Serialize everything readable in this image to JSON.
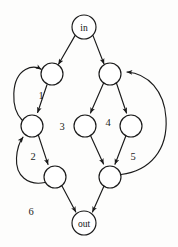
{
  "figure": {
    "type": "directed-graph",
    "background_color": "#fdfdfc",
    "stroke_color": "#1a1a1a",
    "node_fill": "#ffffff",
    "width": 178,
    "height": 247
  },
  "graph_data": {
    "type": "diagram",
    "title": "",
    "nodes": [
      {
        "id": "in",
        "label": "in",
        "cx": 84,
        "cy": 27,
        "r": 12
      },
      {
        "id": "n1",
        "label": "",
        "cx": 52,
        "cy": 74,
        "r": 11
      },
      {
        "id": "n2",
        "label": "",
        "cx": 110,
        "cy": 74,
        "r": 11
      },
      {
        "id": "n3",
        "label": "",
        "cx": 32,
        "cy": 126,
        "r": 11
      },
      {
        "id": "n4",
        "label": "",
        "cx": 85,
        "cy": 126,
        "r": 11
      },
      {
        "id": "n5",
        "label": "",
        "cx": 131,
        "cy": 126,
        "r": 11
      },
      {
        "id": "n6",
        "label": "",
        "cx": 55,
        "cy": 177,
        "r": 11
      },
      {
        "id": "n7",
        "label": "",
        "cx": 110,
        "cy": 177,
        "r": 11
      },
      {
        "id": "out",
        "label": "out",
        "cx": 84,
        "cy": 223,
        "r": 12
      }
    ],
    "edges": [
      {
        "from": "in",
        "to": "n1",
        "style": "straight"
      },
      {
        "from": "in",
        "to": "n2",
        "style": "straight"
      },
      {
        "from": "n1",
        "to": "n3",
        "style": "straight"
      },
      {
        "from": "n3",
        "to": "n1",
        "style": "curve-left"
      },
      {
        "from": "n3",
        "to": "n6",
        "style": "straight"
      },
      {
        "from": "n6",
        "to": "n3",
        "style": "curve-left"
      },
      {
        "from": "n2",
        "to": "n4",
        "style": "straight"
      },
      {
        "from": "n2",
        "to": "n5",
        "style": "straight"
      },
      {
        "from": "n4",
        "to": "n7",
        "style": "straight"
      },
      {
        "from": "n5",
        "to": "n7",
        "style": "straight"
      },
      {
        "from": "n7",
        "to": "n2",
        "style": "curve-right-large"
      },
      {
        "from": "n6",
        "to": "out",
        "style": "straight"
      },
      {
        "from": "n7",
        "to": "out",
        "style": "straight"
      }
    ],
    "region_labels": [
      {
        "text": "1",
        "x": 41,
        "y": 95
      },
      {
        "text": "2",
        "x": 33,
        "y": 156
      },
      {
        "text": "3",
        "x": 62,
        "y": 126
      },
      {
        "text": "4",
        "x": 108,
        "y": 122
      },
      {
        "text": "5",
        "x": 133,
        "y": 156
      },
      {
        "text": "6",
        "x": 31,
        "y": 211
      }
    ]
  }
}
